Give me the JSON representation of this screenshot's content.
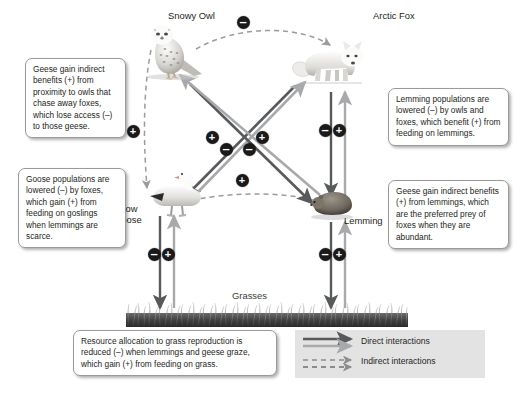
{
  "diagram": {
    "species": [
      {
        "id": "snowy-owl",
        "label": "Snowy Owl"
      },
      {
        "id": "arctic-fox",
        "label": "Arctic Fox"
      },
      {
        "id": "snow-goose",
        "label": "Snow\nGoose"
      },
      {
        "id": "lemming",
        "label": "Lemming"
      },
      {
        "id": "grasses",
        "label": "Grasses"
      }
    ],
    "callouts": [
      {
        "id": "owl-geese",
        "text": "Geese gain indirect benefits (+) from proximity to owls that chase away foxes, which lose access (–) to those geese."
      },
      {
        "id": "goose-fox",
        "text": "Goose populations are lowered (–) by foxes, which gain (+) from feeding on goslings when lemmings are scarce."
      },
      {
        "id": "lemming-pred",
        "text": "Lemming populations are lowered (–) by owls and foxes, which benefit (+) from feeding on lemmings."
      },
      {
        "id": "geese-lemming",
        "text": "Geese gain indirect benefits (+) from lemmings, which are the preferred prey of foxes when they are abundant."
      },
      {
        "id": "grass",
        "text": "Resource allocation to grass reproduction is reduced (–) when lemmings and geese graze, which gain (+) from feeding on grass."
      }
    ],
    "legend": {
      "direct_label": "Direct interactions",
      "indirect_label": "Indirect interactions"
    },
    "signs": [
      {
        "id": "owl-fox-arc",
        "sign": "–",
        "x": 243,
        "y": 22
      },
      {
        "id": "owl-goose-indirect",
        "sign": "+",
        "x": 133,
        "y": 131
      },
      {
        "id": "goose-fox-benefit",
        "sign": "+",
        "x": 212,
        "y": 137
      },
      {
        "id": "goose-fox-cost",
        "sign": "–",
        "x": 226,
        "y": 149
      },
      {
        "id": "lemming-owl-benefit",
        "sign": "+",
        "x": 262,
        "y": 137
      },
      {
        "id": "lemming-owl-cost",
        "sign": "–",
        "x": 249,
        "y": 149
      },
      {
        "id": "goose-lemming-indirect",
        "sign": "+",
        "x": 242,
        "y": 180
      },
      {
        "id": "fox-lemming-cost",
        "sign": "–",
        "x": 325,
        "y": 130
      },
      {
        "id": "fox-lemming-benefit",
        "sign": "+",
        "x": 339,
        "y": 130
      },
      {
        "id": "goose-grass-cost",
        "sign": "–",
        "x": 154,
        "y": 254
      },
      {
        "id": "goose-grass-benefit",
        "sign": "+",
        "x": 168,
        "y": 254
      },
      {
        "id": "lemming-grass-cost",
        "sign": "–",
        "x": 325,
        "y": 254
      },
      {
        "id": "lemming-grass-benefit",
        "sign": "+",
        "x": 339,
        "y": 254
      }
    ],
    "colors": {
      "dark_arrow": "#58595b",
      "light_arrow": "#a7a9ac",
      "badge": "#1a1a1a",
      "text": "#231f20",
      "legend_bg": "#e3e3e3"
    }
  }
}
